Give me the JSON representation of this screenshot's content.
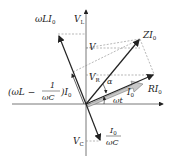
{
  "diagram": {
    "type": "phasor diagram (series RLC)",
    "labels": {
      "VL": "V",
      "VL_sub": "L",
      "wLI0": "ωLI",
      "wLI0_sub": "0",
      "V": "V",
      "ZI0": "ZI",
      "ZI0_sub": "0",
      "VR": "V",
      "VR_sub": "R",
      "alpha": "α",
      "I0": "I",
      "I0_sub": "0",
      "RI0": "RI",
      "RI0_sub": "0",
      "wt": "ωt",
      "combined_left": "(ωL −",
      "combined_frac_num": "1",
      "combined_frac_den": "ωC",
      "combined_right": ")I",
      "combined_sub": "0",
      "VC": "V",
      "VC_sub": "C",
      "cap_num": "I",
      "cap_num_sub": "0",
      "cap_den": "ωC"
    },
    "colors": {
      "line": "#222222",
      "dashed": "#777777",
      "current_arrow": "#bbbbbb"
    }
  }
}
